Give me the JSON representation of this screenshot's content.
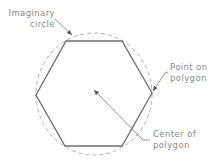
{
  "diagram": {
    "type": "geometry-illustration",
    "labels": {
      "imaginary_circle": {
        "line1": "Imaginary",
        "line2": "circle"
      },
      "point_on_polygon": {
        "line1": "Point on",
        "line2": "polygon"
      },
      "center_of_polygon": {
        "line1": "Center of",
        "line2": "polygon"
      }
    },
    "shapes": {
      "circle": {
        "cx": 94,
        "cy": 94,
        "rx": 58,
        "ry": 61,
        "style": "dashed"
      },
      "hexagon": {
        "vertices": [
          [
            66,
            41
          ],
          [
            122,
            41
          ],
          [
            152,
            93
          ],
          [
            122,
            146
          ],
          [
            65,
            146
          ],
          [
            36,
            95
          ]
        ]
      }
    },
    "colors": {
      "hexagon_stroke": "#6e6e6e",
      "circle_stroke": "#a8a8a8",
      "leader_stroke": "#7a7a7a",
      "text": "#8a8a8a"
    }
  }
}
